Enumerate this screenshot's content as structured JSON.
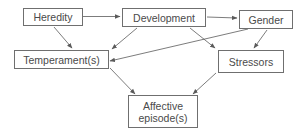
{
  "diagram": {
    "type": "flowchart",
    "colors": {
      "box_border": "#6f6f6f",
      "text": "#4a4a4a",
      "arrow": "#5a5a5a",
      "background": "#ffffff"
    },
    "nodes": {
      "heredity": {
        "label": "Heredity"
      },
      "development": {
        "label": "Development"
      },
      "gender": {
        "label": "Gender"
      },
      "temperament": {
        "label": "Temperament(s)"
      },
      "stressors": {
        "label": "Stressors"
      },
      "affective": {
        "label": "Affective\nepisode(s)"
      }
    },
    "edges": [
      {
        "from": "Heredity",
        "to": "Development"
      },
      {
        "from": "Development",
        "to": "Gender"
      },
      {
        "from": "Heredity",
        "to": "Temperament(s)"
      },
      {
        "from": "Development",
        "to": "Temperament(s)"
      },
      {
        "from": "Development",
        "to": "Stressors"
      },
      {
        "from": "Gender",
        "to": "Temperament(s)"
      },
      {
        "from": "Gender",
        "to": "Stressors"
      },
      {
        "from": "Temperament(s)",
        "to": "Affective episode(s)"
      },
      {
        "from": "Stressors",
        "to": "Affective episode(s)"
      }
    ]
  }
}
